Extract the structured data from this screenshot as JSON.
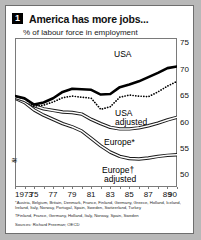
{
  "figure": {
    "badge": "1",
    "title": "America has more jobs...",
    "subtitle": "% of labour force in employment"
  },
  "notes": {
    "star": "*Austria, Belgium, Britain, Denmark, France, Finland, Germany, Greece, Holland, Iceland, Ireland, Italy, Norway, Portugal, Spain, Sweden, Switzerland, Turkey",
    "dagger": "†Finland, France, Germany, Holland, Italy, Norway, Spain, Sweden",
    "source": "Sources: Richard Freeman; OECD"
  },
  "labels": {
    "usa": "USA",
    "usa_adjusted_1": "USA",
    "usa_adjusted_2": "adjusted",
    "europe": "Europe*",
    "europe_adjusted_1": "Europe†",
    "europe_adjusted_2": "adjusted"
  },
  "axis": {
    "break_symbol": "≋",
    "y_ticks": [
      "75",
      "70",
      "65",
      "60",
      "55",
      "50"
    ],
    "x_ticks": [
      "1973",
      "75",
      "77",
      "79",
      "81",
      "83",
      "85",
      "87",
      "89",
      "90"
    ]
  },
  "colors": {
    "ink": "#000000",
    "frame": "#7a7a7a",
    "page": "#ffffff",
    "surround": "#b8b8b8"
  },
  "chart_data": {
    "type": "line",
    "title": "America has more jobs...",
    "subtitle": "% of labour force in employment",
    "xlabel": "",
    "ylabel": "% of labour force in employment",
    "xlim": [
      1973,
      1990
    ],
    "ylim": [
      48,
      76
    ],
    "grid": false,
    "legend": "inline-annotations",
    "x": [
      1973,
      1974,
      1975,
      1976,
      1977,
      1978,
      1979,
      1980,
      1981,
      1982,
      1983,
      1984,
      1985,
      1986,
      1987,
      1988,
      1989,
      1990
    ],
    "series": [
      {
        "name": "USA",
        "style": "solid-thick",
        "values": [
          65.0,
          64.6,
          63.4,
          63.8,
          64.6,
          65.8,
          66.4,
          66.3,
          66.2,
          65.3,
          65.4,
          66.7,
          67.2,
          67.8,
          68.6,
          69.4,
          70.3,
          70.6
        ]
      },
      {
        "name": "USA adjusted",
        "style": "dotted",
        "values": [
          65.0,
          64.5,
          63.1,
          63.3,
          63.9,
          64.7,
          65.0,
          64.8,
          64.6,
          62.5,
          63.0,
          64.8,
          65.2,
          65.0,
          64.9,
          65.8,
          66.9,
          67.8
        ]
      },
      {
        "name": "Europe*",
        "style": "outlined-band",
        "values": [
          64.8,
          64.2,
          63.2,
          62.6,
          62.3,
          62.0,
          61.9,
          61.6,
          60.6,
          59.8,
          59.1,
          58.8,
          58.8,
          59.0,
          59.4,
          59.9,
          60.5,
          61.0
        ]
      },
      {
        "name": "Europe† adjusted",
        "style": "outlined-band",
        "values": [
          64.6,
          63.8,
          62.4,
          61.4,
          60.6,
          59.8,
          59.2,
          58.4,
          57.0,
          55.6,
          54.4,
          53.6,
          53.2,
          53.1,
          53.3,
          53.6,
          53.8,
          53.9
        ]
      }
    ]
  }
}
